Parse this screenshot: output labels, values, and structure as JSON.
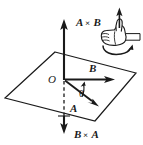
{
  "figure": {
    "background_color": "#ffffff",
    "ink_color": "#1a1a1a",
    "labels": {
      "a_cross_b_operand1": "A",
      "a_cross_b_operator": "×",
      "a_cross_b_operand2": "B",
      "b_cross_a_operand1": "B",
      "b_cross_a_operator": "×",
      "b_cross_a_operand2": "A",
      "vector_b": "B",
      "vector_a": "A",
      "origin": "O",
      "angle": "θ"
    },
    "elements": {
      "plane": "parallelogram-plane",
      "up_axis": "a-cross-b-arrow",
      "down_axis": "b-cross-a-arrow",
      "dashed_axis": "hidden-axis-dashed",
      "hand": "right-hand-thumbs-up",
      "hand_arrow": "thumb-direction-arrow",
      "hand_rotation": "curl-rotation-arrow",
      "angle_arc": "angle-arc-arrow"
    }
  }
}
